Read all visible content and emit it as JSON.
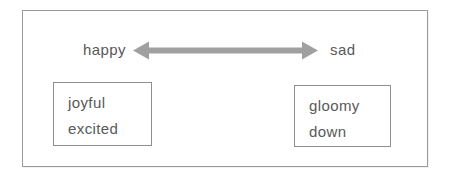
{
  "diagram": {
    "spectrum": {
      "left_term": "happy",
      "right_term": "sad",
      "arrow_icon": "double-headed-arrow"
    },
    "left_box": {
      "words": [
        "joyful",
        "excited"
      ]
    },
    "right_box": {
      "words": [
        "gloomy",
        "down"
      ]
    }
  },
  "colors": {
    "arrow": "#a0a0a0",
    "text": "#595959",
    "frame_border": "#9b9b9b",
    "box_border": "#8e8e8e",
    "background": "#ffffff"
  }
}
